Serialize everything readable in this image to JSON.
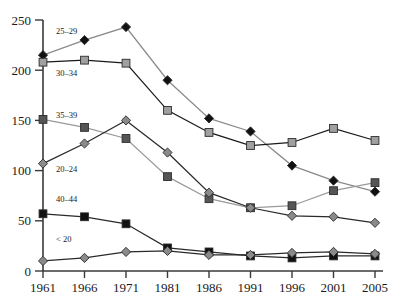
{
  "chart_data": {
    "type": "line",
    "title": "",
    "subtitle": "",
    "xlabel": "",
    "ylabel": "",
    "x": [
      "1961",
      "1966",
      "1971",
      "1981",
      "1986",
      "1991",
      "1996",
      "2001",
      "2005"
    ],
    "xtick_labels": [
      "1961",
      "1966",
      "1971",
      "1981",
      "1986",
      "1991",
      "1996",
      "2001",
      "2005"
    ],
    "ytick_labels": [
      "0",
      "50",
      "100",
      "150",
      "200",
      "250"
    ],
    "yticks": [
      0,
      50,
      100,
      150,
      200,
      250
    ],
    "ylim": [
      0,
      250
    ],
    "grid": false,
    "legend_position": "inline-left",
    "series": [
      {
        "name": "25-29",
        "label": "25–29",
        "color": "#111111",
        "line_color": "#8a8a8a",
        "marker": "diamond",
        "values": [
          215,
          230,
          243,
          190,
          152,
          139,
          105,
          90,
          79
        ]
      },
      {
        "name": "30-34",
        "label": "30–34",
        "color": "#a0a0a0",
        "line_color": "#1a1a1a",
        "marker": "square",
        "values": [
          208,
          210,
          207,
          160,
          138,
          125,
          128,
          142,
          130
        ]
      },
      {
        "name": "35-39",
        "label": "35–39",
        "color": "#555555",
        "line_color": "#9a9a9a",
        "marker": "square",
        "values": [
          151,
          143,
          132,
          94,
          72,
          63,
          65,
          80,
          88
        ]
      },
      {
        "name": "20-24",
        "label": "20–24",
        "color": "#8a8a8a",
        "line_color": "#2a2a2a",
        "marker": "diamond",
        "values": [
          107,
          127,
          150,
          118,
          78,
          63,
          55,
          54,
          48
        ]
      },
      {
        "name": "40-44",
        "label": "40–44",
        "color": "#111111",
        "line_color": "#2a2a2a",
        "marker": "square",
        "values": [
          57,
          54,
          47,
          23,
          19,
          15,
          13,
          15,
          15
        ]
      },
      {
        "name": "< 20",
        "label": "< 20",
        "color": "#8a8a8a",
        "line_color": "#2a2a2a",
        "marker": "diamond",
        "values": [
          10,
          13,
          19,
          20,
          16,
          16,
          18,
          19,
          17
        ]
      }
    ]
  },
  "axis": {
    "y_ticks": [
      "250",
      "200",
      "150",
      "100",
      "50",
      "0"
    ],
    "x_ticks": [
      "1961",
      "1966",
      "1971",
      "1981",
      "1986",
      "1991",
      "1996",
      "2001",
      "2005"
    ]
  },
  "series_labels": {
    "s0": "25–29",
    "s1": "30–34",
    "s2": "35–39",
    "s3": "20–24",
    "s4": "40–44",
    "s5": "< 20"
  }
}
